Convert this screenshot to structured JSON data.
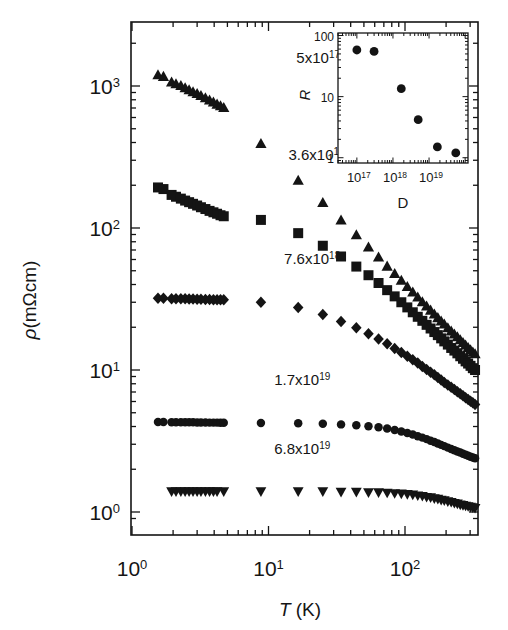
{
  "figure": {
    "background": "#ffffff",
    "ink": "#141414"
  },
  "chart_data": {
    "type": "scatter",
    "title": "",
    "xlabel": "T (K)",
    "ylabel": "ρ(mΩcm)",
    "xscale": "log",
    "yscale": "log",
    "xlim": [
      1.0,
      330.0
    ],
    "ylim": [
      0.85,
      2200.0
    ],
    "xticklabels": [
      "10⁰",
      "10¹",
      "10²"
    ],
    "xtickvalues": [
      1,
      10,
      100
    ],
    "yticklabels": [
      "10⁰",
      "10¹",
      "10²",
      "10³"
    ],
    "ytickvalues": [
      1,
      10,
      100,
      1000
    ],
    "grid": false,
    "legend_position": "inline-annotations",
    "series": [
      {
        "name": "5x10^17",
        "label_mantissa": "5x10",
        "label_exponent": "17",
        "label_x": 16,
        "label_y": 1450,
        "marker": "triangle-up",
        "marker_size": 5.2,
        "color": "#141414",
        "points": [
          [
            1.55,
            1190
          ],
          [
            1.7,
            1160
          ],
          [
            1.95,
            1060
          ],
          [
            2.1,
            1030
          ],
          [
            2.28,
            1000
          ],
          [
            2.45,
            965
          ],
          [
            2.62,
            935
          ],
          [
            2.8,
            905
          ],
          [
            3.0,
            880
          ],
          [
            3.2,
            850
          ],
          [
            3.45,
            820
          ],
          [
            3.7,
            790
          ],
          [
            3.95,
            765
          ],
          [
            4.2,
            740
          ],
          [
            4.45,
            720
          ],
          [
            4.7,
            700
          ],
          [
            8.8,
            390
          ],
          [
            16.5,
            215
          ],
          [
            25.0,
            150
          ],
          [
            34.0,
            113
          ],
          [
            44.0,
            89
          ],
          [
            54.0,
            73
          ],
          [
            64.0,
            62
          ],
          [
            74.0,
            53.5
          ],
          [
            84.0,
            47.5
          ],
          [
            94.0,
            42.5
          ],
          [
            104,
            38.5
          ],
          [
            114,
            35.2
          ],
          [
            124,
            32.4
          ],
          [
            134,
            30.0
          ],
          [
            144,
            28.0
          ],
          [
            154,
            26.2
          ],
          [
            164,
            24.6
          ],
          [
            174,
            23.2
          ],
          [
            184,
            22.0
          ],
          [
            194,
            20.9
          ],
          [
            206,
            19.7
          ],
          [
            218,
            18.7
          ],
          [
            230,
            17.8
          ],
          [
            242,
            17.0
          ],
          [
            254,
            16.2
          ],
          [
            266,
            15.5
          ],
          [
            278,
            14.9
          ],
          [
            290,
            14.3
          ],
          [
            302,
            13.8
          ],
          [
            314,
            13.3
          ],
          [
            326,
            12.9
          ]
        ]
      },
      {
        "name": "3.6x10^18",
        "label_mantissa": "3.6x10",
        "label_exponent": "18",
        "label_x": 14,
        "label_y": 300,
        "marker": "square",
        "marker_size": 5.0,
        "color": "#141414",
        "points": [
          [
            1.55,
            193
          ],
          [
            1.7,
            188
          ],
          [
            1.95,
            171
          ],
          [
            2.1,
            166
          ],
          [
            2.28,
            161
          ],
          [
            2.45,
            156
          ],
          [
            2.62,
            152
          ],
          [
            2.8,
            148
          ],
          [
            3.0,
            144
          ],
          [
            3.2,
            140
          ],
          [
            3.45,
            136
          ],
          [
            3.7,
            132
          ],
          [
            3.95,
            129
          ],
          [
            4.2,
            126
          ],
          [
            4.45,
            123
          ],
          [
            4.7,
            121
          ],
          [
            8.8,
            114
          ],
          [
            16.5,
            92
          ],
          [
            25.0,
            75
          ],
          [
            34.0,
            63
          ],
          [
            44.0,
            53.5
          ],
          [
            54.0,
            46.5
          ],
          [
            64.0,
            41.0
          ],
          [
            74.0,
            36.5
          ],
          [
            84.0,
            33.0
          ],
          [
            94.0,
            30.0
          ],
          [
            104,
            27.6
          ],
          [
            114,
            25.5
          ],
          [
            124,
            23.7
          ],
          [
            134,
            22.2
          ],
          [
            144,
            20.8
          ],
          [
            154,
            19.6
          ],
          [
            164,
            18.5
          ],
          [
            174,
            17.6
          ],
          [
            184,
            16.7
          ],
          [
            194,
            15.9
          ],
          [
            206,
            15.1
          ],
          [
            218,
            14.3
          ],
          [
            230,
            13.7
          ],
          [
            242,
            13.1
          ],
          [
            254,
            12.5
          ],
          [
            266,
            12.0
          ],
          [
            278,
            11.5
          ],
          [
            290,
            11.1
          ],
          [
            302,
            10.7
          ],
          [
            314,
            10.3
          ],
          [
            326,
            10.0
          ]
        ]
      },
      {
        "name": "7.6x10^18",
        "label_mantissa": "7.6x10",
        "label_exponent": "18",
        "label_x": 13,
        "label_y": 56,
        "marker": "diamond",
        "marker_size": 5.0,
        "color": "#141414",
        "points": [
          [
            1.55,
            32
          ],
          [
            1.7,
            32
          ],
          [
            1.95,
            31.8
          ],
          [
            2.1,
            31.8
          ],
          [
            2.28,
            31.7
          ],
          [
            2.45,
            31.7
          ],
          [
            2.62,
            31.6
          ],
          [
            2.8,
            31.6
          ],
          [
            3.0,
            31.5
          ],
          [
            3.2,
            31.5
          ],
          [
            3.45,
            31.4
          ],
          [
            3.7,
            31.4
          ],
          [
            3.95,
            31.3
          ],
          [
            4.2,
            31.3
          ],
          [
            4.45,
            31.2
          ],
          [
            4.7,
            31.2
          ],
          [
            8.8,
            30.0
          ],
          [
            16.5,
            27.5
          ],
          [
            25.0,
            24.6
          ],
          [
            34.0,
            22.0
          ],
          [
            44.0,
            19.8
          ],
          [
            54.0,
            18.0
          ],
          [
            64.0,
            16.5
          ],
          [
            74.0,
            15.3
          ],
          [
            84.0,
            14.2
          ],
          [
            94.0,
            13.3
          ],
          [
            104,
            12.5
          ],
          [
            114,
            11.8
          ],
          [
            124,
            11.2
          ],
          [
            134,
            10.6
          ],
          [
            144,
            10.1
          ],
          [
            154,
            9.65
          ],
          [
            164,
            9.25
          ],
          [
            174,
            8.85
          ],
          [
            184,
            8.5
          ],
          [
            194,
            8.18
          ],
          [
            206,
            7.85
          ],
          [
            218,
            7.55
          ],
          [
            230,
            7.28
          ],
          [
            242,
            7.03
          ],
          [
            254,
            6.8
          ],
          [
            266,
            6.58
          ],
          [
            278,
            6.38
          ],
          [
            290,
            6.2
          ],
          [
            302,
            6.03
          ],
          [
            314,
            5.87
          ],
          [
            326,
            5.72
          ]
        ]
      },
      {
        "name": "1.7x10^19",
        "label_mantissa": "1.7x10",
        "label_exponent": "19",
        "label_x": 11,
        "label_y": 7.8,
        "marker": "circle",
        "marker_size": 4.6,
        "color": "#141414",
        "points": [
          [
            1.55,
            4.3
          ],
          [
            1.7,
            4.3
          ],
          [
            1.95,
            4.29
          ],
          [
            2.1,
            4.29
          ],
          [
            2.28,
            4.29
          ],
          [
            2.45,
            4.28
          ],
          [
            2.62,
            4.28
          ],
          [
            2.8,
            4.28
          ],
          [
            3.0,
            4.27
          ],
          [
            3.2,
            4.27
          ],
          [
            3.45,
            4.27
          ],
          [
            3.7,
            4.26
          ],
          [
            3.95,
            4.26
          ],
          [
            4.2,
            4.26
          ],
          [
            4.45,
            4.25
          ],
          [
            4.7,
            4.25
          ],
          [
            8.8,
            4.24
          ],
          [
            16.5,
            4.22
          ],
          [
            25.0,
            4.18
          ],
          [
            34.0,
            4.14
          ],
          [
            44.0,
            4.08
          ],
          [
            54.0,
            4.02
          ],
          [
            64.0,
            3.95
          ],
          [
            74.0,
            3.87
          ],
          [
            84.0,
            3.78
          ],
          [
            94.0,
            3.69
          ],
          [
            104,
            3.6
          ],
          [
            114,
            3.51
          ],
          [
            124,
            3.42
          ],
          [
            134,
            3.34
          ],
          [
            144,
            3.26
          ],
          [
            154,
            3.18
          ],
          [
            164,
            3.11
          ],
          [
            174,
            3.04
          ],
          [
            184,
            2.97
          ],
          [
            194,
            2.91
          ],
          [
            206,
            2.84
          ],
          [
            218,
            2.78
          ],
          [
            230,
            2.72
          ],
          [
            242,
            2.67
          ],
          [
            254,
            2.62
          ],
          [
            266,
            2.57
          ],
          [
            278,
            2.53
          ],
          [
            290,
            2.49
          ],
          [
            302,
            2.45
          ],
          [
            314,
            2.42
          ],
          [
            326,
            2.39
          ]
        ]
      },
      {
        "name": "6.8x10^19",
        "label_mantissa": "6.8x10",
        "label_exponent": "19",
        "label_x": 11,
        "label_y": 2.55,
        "marker": "triangle-down",
        "marker_size": 5.0,
        "color": "#141414",
        "points": [
          [
            1.95,
            1.4
          ],
          [
            2.1,
            1.4
          ],
          [
            2.28,
            1.4
          ],
          [
            2.45,
            1.4
          ],
          [
            2.62,
            1.4
          ],
          [
            2.8,
            1.4
          ],
          [
            3.0,
            1.4
          ],
          [
            3.2,
            1.4
          ],
          [
            3.45,
            1.4
          ],
          [
            3.7,
            1.4
          ],
          [
            3.95,
            1.4
          ],
          [
            4.2,
            1.4
          ],
          [
            4.7,
            1.4
          ],
          [
            8.8,
            1.4
          ],
          [
            16.5,
            1.4
          ],
          [
            25.0,
            1.4
          ],
          [
            34.0,
            1.39
          ],
          [
            44.0,
            1.39
          ],
          [
            54.0,
            1.38
          ],
          [
            64.0,
            1.38
          ],
          [
            74.0,
            1.37
          ],
          [
            84.0,
            1.36
          ],
          [
            94.0,
            1.35
          ],
          [
            104,
            1.34
          ],
          [
            114,
            1.33
          ],
          [
            124,
            1.31
          ],
          [
            134,
            1.3
          ],
          [
            144,
            1.28
          ],
          [
            154,
            1.27
          ],
          [
            164,
            1.25
          ],
          [
            174,
            1.24
          ],
          [
            184,
            1.22
          ],
          [
            194,
            1.21
          ],
          [
            206,
            1.19
          ],
          [
            218,
            1.18
          ],
          [
            230,
            1.16
          ],
          [
            242,
            1.15
          ],
          [
            254,
            1.13
          ],
          [
            266,
            1.12
          ],
          [
            278,
            1.11
          ],
          [
            290,
            1.1
          ],
          [
            302,
            1.09
          ],
          [
            314,
            1.08
          ],
          [
            326,
            1.07
          ]
        ]
      }
    ],
    "inset": {
      "type": "scatter",
      "xlabel": "D",
      "ylabel": "R",
      "xscale": "log",
      "yscale": "log",
      "xlim": [
        3e+16,
        1.2e+20
      ],
      "ylim": [
        0.82,
        110
      ],
      "xticklabels": [
        "10¹⁷",
        "10¹⁸",
        "10¹⁹"
      ],
      "xtickvalues": [
        1e+17,
        1e+18,
        1e+19
      ],
      "yticklabels": [
        "1",
        "10",
        "100"
      ],
      "ytickvalues": [
        1,
        10,
        100
      ],
      "marker": "circle",
      "marker_size": 4.4,
      "color": "#141414",
      "x": [
        1e+17,
        3e+17,
        1.7e+18,
        5e+18,
        1.7e+19,
        5.5e+19
      ],
      "y": [
        58,
        55,
        13.5,
        4.2,
        1.5,
        1.2
      ]
    }
  },
  "labels": {
    "y_axis": "ρ(mΩcm)",
    "x_axis_italic": "T",
    "x_axis_rest": " (K)",
    "inset_y": "R",
    "inset_x": "D"
  }
}
